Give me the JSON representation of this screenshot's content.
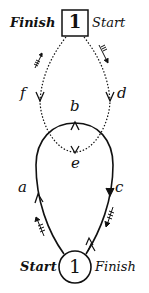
{
  "diagram": {
    "top_node": {
      "shape": "square",
      "label": "1",
      "left_label": "Finish",
      "right_label": "Start"
    },
    "bottom_node": {
      "shape": "circle",
      "label": "1",
      "left_label": "Start",
      "right_label": "Finish"
    },
    "path_labels": {
      "a": "a",
      "b": "b",
      "c": "c",
      "d": "d",
      "e": "e",
      "f": "f"
    },
    "edges": [
      {
        "from": "top_node",
        "to": "d",
        "style": "dotted",
        "direction": "down-right"
      },
      {
        "from": "d",
        "to": "e",
        "style": "dotted"
      },
      {
        "from": "e",
        "to": "f",
        "style": "dotted"
      },
      {
        "from": "f",
        "to": "top_node",
        "style": "dotted",
        "direction": "up-left"
      },
      {
        "from": "bottom_node",
        "to": "a",
        "style": "solid"
      },
      {
        "from": "a",
        "to": "b",
        "style": "solid"
      },
      {
        "from": "b",
        "to": "c",
        "style": "solid"
      },
      {
        "from": "c",
        "to": "bottom_node",
        "style": "solid"
      }
    ],
    "colors": {
      "ink": "#111111",
      "background": "#ffffff"
    }
  }
}
